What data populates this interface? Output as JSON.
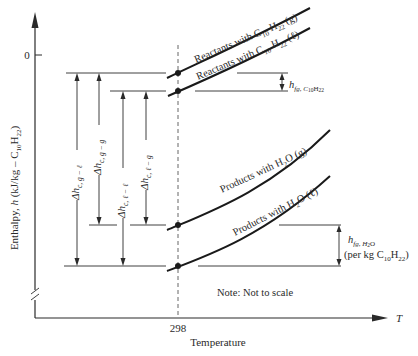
{
  "figure": {
    "y_axis": {
      "label_prefix": "Enthalpy, ",
      "label_var": "h",
      "label_unit_open": " (kJ/kg – C",
      "label_sub1": "10",
      "label_mid": "H",
      "label_sub2": "22",
      "label_close": ")",
      "zero_tick": "0"
    },
    "x_axis": {
      "var": "T",
      "tick": "298",
      "label": "Temperature"
    },
    "curves": {
      "reactants_gas": {
        "text": "Reactants with C",
        "sub1": "10",
        "mid": " H",
        "sub2": "22",
        "state": " (g)"
      },
      "reactants_liquid": {
        "text": "Reactants with C",
        "sub1": "10",
        "mid": " H",
        "sub2": "22",
        "state": " (ℓ)"
      },
      "products_gas": {
        "text": "Products with H",
        "sub": "2",
        "tail": "O (g)"
      },
      "products_liquid": {
        "text": "Products with H",
        "sub": "2",
        "tail": "O (ℓ)"
      }
    },
    "delta_h": {
      "g_l": {
        "main": "Δh",
        "sub": "c, g − ℓ"
      },
      "g_g": {
        "main": "Δh",
        "sub": "c, g − g"
      },
      "l_l": {
        "main": "Δh",
        "sub": "c, ℓ − ℓ"
      },
      "l_g": {
        "main": "Δh",
        "sub": "c, ℓ − g"
      }
    },
    "hfg_fuel": {
      "main": "h",
      "sub": "fg, C",
      "sub2": "10",
      "sub3": "H",
      "sub4": "22"
    },
    "hfg_water": {
      "main": "h",
      "sub": "fg, H",
      "sub2": "2",
      "sub3": "O",
      "line2_open": "(per kg C",
      "line2_sub1": "10",
      "line2_mid": "H",
      "line2_sub2": "22",
      "line2_close": ")"
    },
    "note": "Note: Not to scale"
  },
  "colors": {
    "ink": "#2a2a2a",
    "curve": "#1a1a1a",
    "dash": "#555555"
  }
}
